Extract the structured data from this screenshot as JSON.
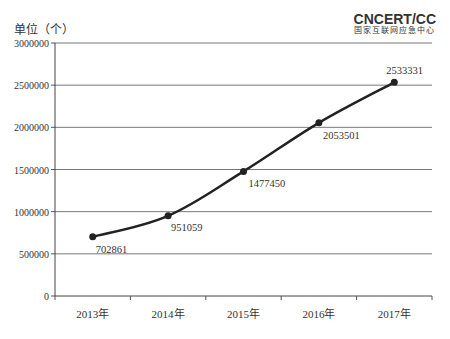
{
  "chart_data": {
    "type": "line",
    "title": "",
    "ylabel": "单位（个）",
    "xlabel": "",
    "categories": [
      "2013年",
      "2014年",
      "2015年",
      "2016年",
      "2017年"
    ],
    "values": [
      702861,
      951059,
      1477450,
      2053501,
      2533331
    ],
    "series": [
      {
        "name": "数量",
        "values": [
          702861,
          951059,
          1477450,
          2053501,
          2533331
        ]
      }
    ],
    "data_labels": [
      "702861",
      "951059",
      "1477450",
      "2053501",
      "2533331"
    ],
    "ylim": [
      0,
      3000000
    ],
    "yticks": [
      "0",
      "500000",
      "1000000",
      "1500000",
      "2000000",
      "2500000",
      "3000000"
    ],
    "grid": true,
    "legend": "none",
    "line_color": "#222222"
  },
  "header": {
    "unit_label": "单位（个）",
    "logo_text": "CNCERT/CC",
    "logo_subtitle": "国家互联网应急中心"
  }
}
